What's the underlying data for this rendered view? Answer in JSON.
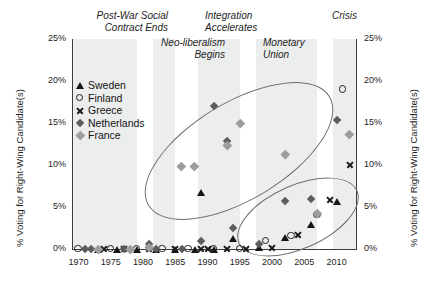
{
  "chart_data": {
    "type": "scatter",
    "title": "",
    "xlabel": "",
    "ylabel": "% Voting for Right-Wing Candidate(s)",
    "ylabel_right": "% Voting for Right-Wing Candidate(s)",
    "xlim": [
      1969,
      2013
    ],
    "ylim": [
      0,
      25
    ],
    "grid": false,
    "legend_position": "upper-left inside plot",
    "x_ticks": [
      "1970",
      "1975",
      "1980",
      "1985",
      "1990",
      "1995",
      "2000",
      "2005",
      "2010"
    ],
    "x_tick_values": [
      1970,
      1975,
      1980,
      1985,
      1990,
      1995,
      2000,
      2005,
      2010
    ],
    "y_ticks": [
      "0%",
      "5%",
      "10%",
      "15%",
      "20%",
      "25%"
    ],
    "y_tick_values": [
      0,
      5,
      10,
      15,
      20,
      25
    ],
    "series": [
      {
        "name": "Sweden",
        "marker": "triangle",
        "color": "#161616",
        "points": [
          {
            "x": 1973,
            "y": 0.0
          },
          {
            "x": 1976,
            "y": 0.0
          },
          {
            "x": 1979,
            "y": 0.0
          },
          {
            "x": 1982,
            "y": 0.0
          },
          {
            "x": 1985,
            "y": 0.0
          },
          {
            "x": 1988,
            "y": 0.0
          },
          {
            "x": 1991,
            "y": 0.0
          },
          {
            "x": 1994,
            "y": 1.2
          },
          {
            "x": 1998,
            "y": 0.2
          },
          {
            "x": 2002,
            "y": 1.4
          },
          {
            "x": 2006,
            "y": 2.9
          },
          {
            "x": 2010,
            "y": 5.7
          },
          {
            "x": 1989,
            "y": 6.7
          }
        ]
      },
      {
        "name": "Finland",
        "marker": "circle",
        "color": "#1a1a1a",
        "points": [
          {
            "x": 1970,
            "y": 0.0
          },
          {
            "x": 1975,
            "y": 0.0
          },
          {
            "x": 1979,
            "y": 0.0
          },
          {
            "x": 1983,
            "y": 0.0
          },
          {
            "x": 1987,
            "y": 0.0
          },
          {
            "x": 1991,
            "y": 0.0
          },
          {
            "x": 1995,
            "y": 0.0
          },
          {
            "x": 1999,
            "y": 1.0
          },
          {
            "x": 2003,
            "y": 1.6
          },
          {
            "x": 2007,
            "y": 4.1
          },
          {
            "x": 2011,
            "y": 19.0
          }
        ]
      },
      {
        "name": "Greece",
        "marker": "x",
        "color": "#1a1a1a",
        "points": [
          {
            "x": 1974,
            "y": 0.0
          },
          {
            "x": 1977,
            "y": 0.0
          },
          {
            "x": 1981,
            "y": 0.0
          },
          {
            "x": 1985,
            "y": 0.0
          },
          {
            "x": 1989,
            "y": 0.0
          },
          {
            "x": 1990,
            "y": 0.0
          },
          {
            "x": 1993,
            "y": 0.0
          },
          {
            "x": 1996,
            "y": 0.0
          },
          {
            "x": 2000,
            "y": 0.2
          },
          {
            "x": 2004,
            "y": 1.7
          },
          {
            "x": 2009,
            "y": 5.8
          },
          {
            "x": 2012,
            "y": 10.0
          }
        ]
      },
      {
        "name": "Netherlands",
        "marker": "diamond-dark",
        "color": "#5c5c5c",
        "points": [
          {
            "x": 1971,
            "y": 0.0
          },
          {
            "x": 1972,
            "y": 0.0
          },
          {
            "x": 1977,
            "y": 0.0
          },
          {
            "x": 1981,
            "y": 0.6
          },
          {
            "x": 1982,
            "y": 0.0
          },
          {
            "x": 1986,
            "y": 0.0
          },
          {
            "x": 1989,
            "y": 0.9
          },
          {
            "x": 1994,
            "y": 2.5
          },
          {
            "x": 1998,
            "y": 0.6
          },
          {
            "x": 2002,
            "y": 5.7
          },
          {
            "x": 2006,
            "y": 5.9
          },
          {
            "x": 2010,
            "y": 15.4
          },
          {
            "x": 1993,
            "y": 12.9
          },
          {
            "x": 1991,
            "y": 17.0
          }
        ]
      },
      {
        "name": "France",
        "marker": "diamond-light",
        "color": "#9d9d9d",
        "points": [
          {
            "x": 1973,
            "y": 0.0
          },
          {
            "x": 1978,
            "y": 0.0
          },
          {
            "x": 1981,
            "y": 0.2
          },
          {
            "x": 1986,
            "y": 9.8
          },
          {
            "x": 1988,
            "y": 9.9
          },
          {
            "x": 1993,
            "y": 12.4
          },
          {
            "x": 1995,
            "y": 15.0
          },
          {
            "x": 2002,
            "y": 11.3
          },
          {
            "x": 2007,
            "y": 4.3
          },
          {
            "x": 2012,
            "y": 13.6
          }
        ]
      }
    ],
    "annotations": [
      {
        "id": "post-war-social-contract-ends",
        "text": "Post-War Social\nContract Ends"
      },
      {
        "id": "neo-liberalism-begins",
        "text": "Neo-liberalism\nBegins"
      },
      {
        "id": "integration-accelerates",
        "text": "Integration\nAccelerates"
      },
      {
        "id": "monetary-union",
        "text": "Monetary\nUnion"
      },
      {
        "id": "crisis",
        "text": "Crisis"
      }
    ],
    "shaded_bands": [
      {
        "id": "band-post-war",
        "from": 1969,
        "to": 1979
      },
      {
        "id": "band-neoliberalism",
        "from": 1981.5,
        "to": 1985
      },
      {
        "id": "band-integration",
        "from": 1988.5,
        "to": 1995
      },
      {
        "id": "band-monetary-union",
        "from": 1997.5,
        "to": 2007
      },
      {
        "id": "band-crisis",
        "from": 2009.5,
        "to": 2013
      }
    ],
    "ellipses": [
      {
        "id": "ellipse-upper-cluster"
      },
      {
        "id": "ellipse-lower-cluster"
      }
    ]
  },
  "legend": {
    "items": [
      {
        "label": "Sweden",
        "marker": "triangle"
      },
      {
        "label": "Finland",
        "marker": "circle"
      },
      {
        "label": "Greece",
        "marker": "x"
      },
      {
        "label": "Netherlands",
        "marker": "diamond-dark"
      },
      {
        "label": "France",
        "marker": "diamond-light"
      }
    ]
  }
}
